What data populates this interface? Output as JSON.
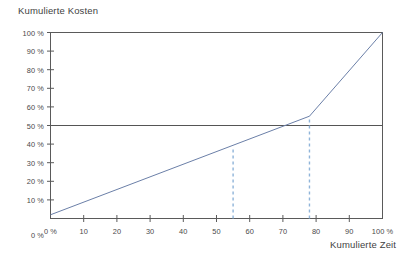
{
  "chart_data": {
    "type": "line",
    "title": "",
    "ylabel": "Kumulierte Kosten",
    "xlabel": "Kumulierte Zeit",
    "xlim": [
      0,
      100
    ],
    "ylim": [
      0,
      100
    ],
    "grid": false,
    "legend": "none",
    "x_ticks": [
      0,
      10,
      20,
      30,
      40,
      50,
      60,
      70,
      80,
      90,
      100
    ],
    "x_tick_labels": [
      "0 %",
      "10",
      "20",
      "30",
      "40",
      "50",
      "60",
      "70",
      "80",
      "90",
      "100 %"
    ],
    "y_ticks": [
      0,
      10,
      20,
      30,
      40,
      50,
      60,
      70,
      80,
      90,
      100
    ],
    "y_tick_labels": [
      "0 %",
      "10 %",
      "20 %",
      "30 %",
      "40 %",
      "50 %",
      "60 %",
      "70 %",
      "80 %",
      "90 %",
      "100 %"
    ],
    "series": [
      {
        "name": "Kumulierte Kosten",
        "type": "line",
        "color": "#6b7fa8",
        "points": [
          {
            "x": 0,
            "y": 2
          },
          {
            "x": 78,
            "y": 55
          },
          {
            "x": 100,
            "y": 100
          }
        ]
      }
    ],
    "reference_lines": [
      {
        "name": "50-prozent-kosten-linie",
        "orientation": "horizontal",
        "value": 50,
        "style": "solid",
        "color": "#555555"
      },
      {
        "name": "marker-55-prozent",
        "orientation": "vertical",
        "value": 55,
        "y_top": 38,
        "style": "dashed",
        "color": "#8fb4d9"
      },
      {
        "name": "marker-78-prozent",
        "orientation": "vertical",
        "value": 78,
        "y_top": 55,
        "style": "dashed",
        "color": "#8fb4d9"
      }
    ],
    "colors": {
      "axis": "#5a5a5a",
      "plot_border": "#5a5a5a",
      "curve": "#6b7fa8",
      "reference": "#555555",
      "marker": "#8fb4d9",
      "text": "#3f3f3f",
      "background": "#ffffff"
    }
  }
}
